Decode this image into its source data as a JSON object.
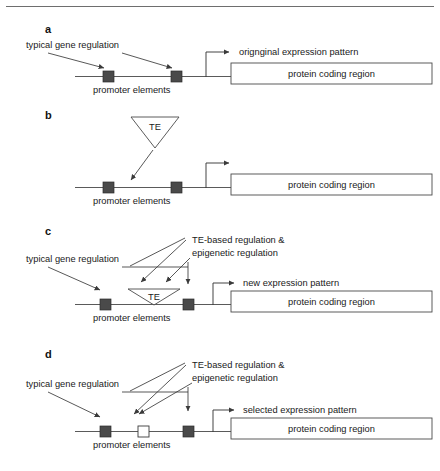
{
  "figure": {
    "title_rule": "horizontal-rule",
    "labels": {
      "promoter_elements": "promoter elements",
      "protein_coding_region": "protein coding region",
      "typical_gene_regulation": "typical gene regulation",
      "te": "TE",
      "te_based_line1": "TE-based regulation &",
      "te_based_line2": "epigenetic regulation"
    },
    "panels": [
      {
        "letter": "a",
        "expression_pattern": "orignginal expression pattern",
        "has_typical_regulation_label": true,
        "has_te_triangle": false,
        "has_te_annotation": false,
        "middle_element": "none"
      },
      {
        "letter": "b",
        "expression_pattern": "",
        "has_typical_regulation_label": false,
        "has_te_triangle": true,
        "has_te_annotation": false,
        "middle_element": "none"
      },
      {
        "letter": "c",
        "expression_pattern": "new expression pattern",
        "has_typical_regulation_label": true,
        "has_te_triangle": true,
        "has_te_annotation": true,
        "middle_element": "te-inserted"
      },
      {
        "letter": "d",
        "expression_pattern": "selected expression pattern",
        "has_typical_regulation_label": true,
        "has_te_triangle": false,
        "has_te_annotation": true,
        "middle_element": "empty-box"
      }
    ]
  },
  "colors": {
    "promoter_fill": "#4a4a4a",
    "line": "#5a5a5a",
    "text": "#1a1a1a",
    "background": "#ffffff"
  }
}
